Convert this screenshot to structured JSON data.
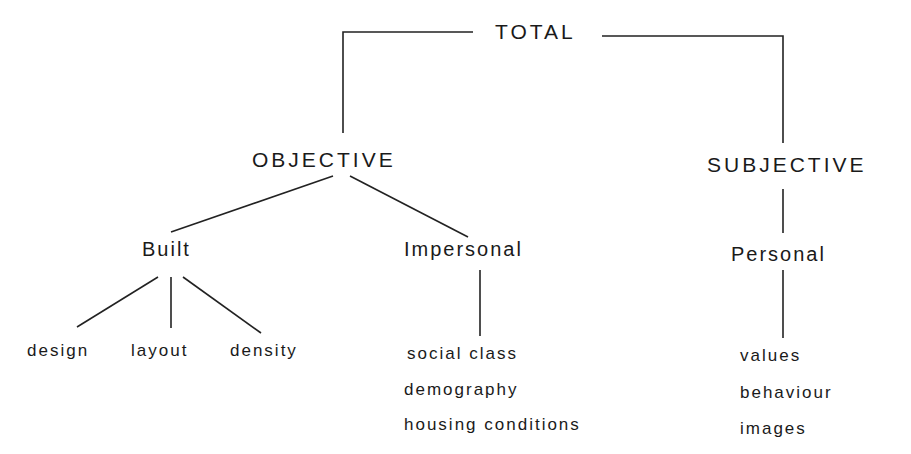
{
  "diagram": {
    "root": {
      "label": "TOTAL"
    },
    "level1": [
      {
        "id": "objective",
        "label": "OBJECTIVE"
      },
      {
        "id": "subjective",
        "label": "SUBJECTIVE"
      }
    ],
    "level2": [
      {
        "id": "built",
        "parent": "objective",
        "label": "Built"
      },
      {
        "id": "impersonal",
        "parent": "objective",
        "label": "Impersonal"
      },
      {
        "id": "personal",
        "parent": "subjective",
        "label": "Personal"
      }
    ],
    "leaves": {
      "built": [
        "design",
        "layout",
        "density"
      ],
      "impersonal": [
        "social class",
        "demography",
        "housing conditions"
      ],
      "personal": [
        "values",
        "behaviour",
        "images"
      ]
    }
  }
}
